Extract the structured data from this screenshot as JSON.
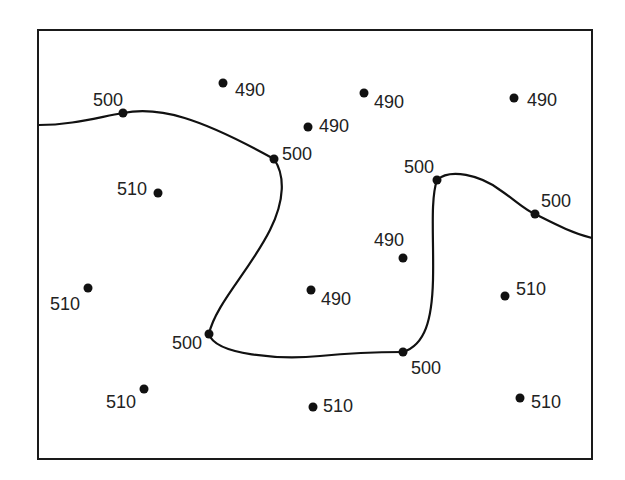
{
  "diagram": {
    "type": "isoline-map",
    "frame": {
      "x": 38,
      "y": 30,
      "width": 554,
      "height": 429,
      "color": "#1a1a1a"
    },
    "contours": [
      {
        "value": 500,
        "name": "left-contour"
      },
      {
        "value": 500,
        "name": "right-contour"
      }
    ],
    "points": [
      {
        "x": 223,
        "y": 83,
        "value": "490",
        "lx": 235,
        "ly": 96,
        "anchor": "start"
      },
      {
        "x": 364,
        "y": 93,
        "value": "490",
        "lx": 374,
        "ly": 108,
        "anchor": "start"
      },
      {
        "x": 514,
        "y": 98,
        "value": "490",
        "lx": 527,
        "ly": 106,
        "anchor": "start"
      },
      {
        "x": 308,
        "y": 127,
        "value": "490",
        "lx": 319,
        "ly": 132,
        "anchor": "start"
      },
      {
        "x": 123,
        "y": 113,
        "value": "500",
        "lx": 123,
        "ly": 106,
        "anchor": "end"
      },
      {
        "x": 274,
        "y": 159,
        "value": "500",
        "lx": 282,
        "ly": 160,
        "anchor": "start"
      },
      {
        "x": 437,
        "y": 180,
        "value": "500",
        "lx": 434,
        "ly": 173,
        "anchor": "end"
      },
      {
        "x": 535,
        "y": 214,
        "value": "500",
        "lx": 541,
        "ly": 207,
        "anchor": "start"
      },
      {
        "x": 158,
        "y": 193,
        "value": "510",
        "lx": 147,
        "ly": 195,
        "anchor": "end"
      },
      {
        "x": 403,
        "y": 258,
        "value": "490",
        "lx": 404,
        "ly": 246,
        "anchor": "end"
      },
      {
        "x": 88,
        "y": 288,
        "value": "510",
        "lx": 80,
        "ly": 310,
        "anchor": "end"
      },
      {
        "x": 311,
        "y": 290,
        "value": "490",
        "lx": 321,
        "ly": 305,
        "anchor": "start"
      },
      {
        "x": 505,
        "y": 296,
        "value": "510",
        "lx": 516,
        "ly": 295,
        "anchor": "start"
      },
      {
        "x": 209,
        "y": 334,
        "value": "500",
        "lx": 202,
        "ly": 349,
        "anchor": "end"
      },
      {
        "x": 403,
        "y": 352,
        "value": "500",
        "lx": 411,
        "ly": 374,
        "anchor": "start"
      },
      {
        "x": 144,
        "y": 389,
        "value": "510",
        "lx": 136,
        "ly": 408,
        "anchor": "end"
      },
      {
        "x": 313,
        "y": 407,
        "value": "510",
        "lx": 323,
        "ly": 412,
        "anchor": "start"
      },
      {
        "x": 520,
        "y": 398,
        "value": "510",
        "lx": 531,
        "ly": 408,
        "anchor": "start"
      }
    ]
  }
}
